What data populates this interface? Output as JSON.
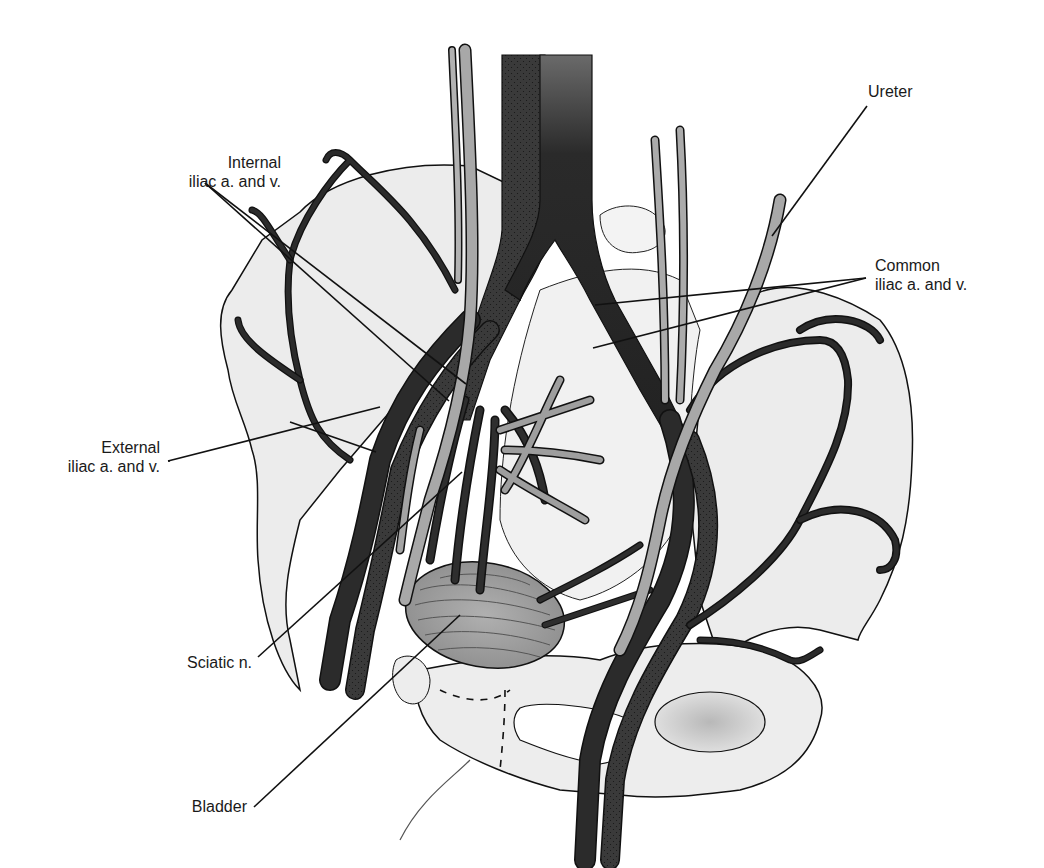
{
  "figure": {
    "type": "anatomical-illustration",
    "top_caption_cropped": "(text cut off at top edge)"
  },
  "labels": {
    "internal_iliac": {
      "line1": "Internal",
      "line2": "iliac a. and v."
    },
    "external_iliac": {
      "line1": "External",
      "line2": "iliac a. and v."
    },
    "sciatic": {
      "line1": "Sciatic n."
    },
    "bladder": {
      "line1": "Bladder"
    },
    "ureter": {
      "line1": "Ureter"
    },
    "common_iliac": {
      "line1": "Common",
      "line2": "iliac a. and v."
    }
  },
  "colors": {
    "background": "#ffffff",
    "bone_fill": "#ebebeb",
    "outline": "#111111",
    "vessel_dark": "#2b2b2b",
    "vessel_stipple": "#3d3d3d",
    "ureter_nerve": "#a8a8a8",
    "bladder": "#9a9a9a",
    "leader_line": "#111111"
  }
}
